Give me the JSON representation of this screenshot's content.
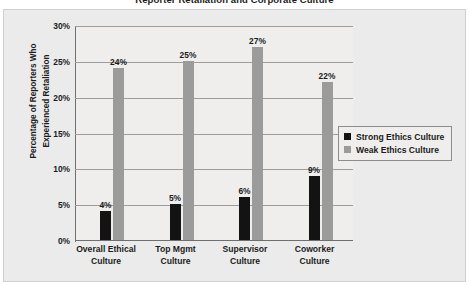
{
  "chart_data": {
    "type": "bar",
    "title": "Reporter Retaliation and Corporate Culture",
    "xlabel": "",
    "ylabel_line1": "Percentage of Reporters Who",
    "ylabel_line2": "Experienced Retaliation",
    "ylim": [
      0,
      30
    ],
    "y_ticks": [
      "0%",
      "5%",
      "10%",
      "15%",
      "20%",
      "25%",
      "30%"
    ],
    "y_tick_values": [
      0,
      5,
      10,
      15,
      20,
      25,
      30
    ],
    "grid": true,
    "legend_position": "center-right",
    "categories": [
      {
        "line1": "Overall Ethical",
        "line2": "Culture"
      },
      {
        "line1": "Top Mgmt",
        "line2": "Culture"
      },
      {
        "line1": "Supervisor",
        "line2": "Culture"
      },
      {
        "line1": "Coworker",
        "line2": "Culture"
      }
    ],
    "series": [
      {
        "name": "Strong Ethics Culture",
        "color": "#131313",
        "values": [
          4,
          5,
          6,
          9
        ],
        "labels": [
          "4%",
          "5%",
          "6%",
          "9%"
        ]
      },
      {
        "name": "Weak Ethics Culture",
        "color": "#9b9b9b",
        "values": [
          24,
          25,
          27,
          22
        ],
        "labels": [
          "24%",
          "25%",
          "27%",
          "22%"
        ]
      }
    ]
  }
}
